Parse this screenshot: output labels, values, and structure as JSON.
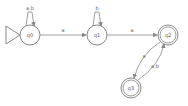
{
  "diagram": {
    "type": "finite-automaton",
    "states": [
      {
        "id": "q0",
        "label": "q0",
        "start": true,
        "accept": false
      },
      {
        "id": "q1",
        "label": "q1",
        "start": false,
        "accept": false
      },
      {
        "id": "q2",
        "label": "q2",
        "start": false,
        "accept": true
      },
      {
        "id": "q3",
        "label": "q3",
        "start": false,
        "accept": true
      }
    ],
    "transitions": [
      {
        "from": "q0",
        "to": "q0",
        "label": "a,b"
      },
      {
        "from": "q0",
        "to": "q1",
        "label": "a"
      },
      {
        "from": "q1",
        "to": "q1",
        "label": "b"
      },
      {
        "from": "q1",
        "to": "q2",
        "label": "a"
      },
      {
        "from": "q2",
        "to": "q3",
        "label": "a"
      },
      {
        "from": "q3",
        "to": "q2",
        "label": "a,b"
      }
    ],
    "colors": {
      "stroke": "#888888",
      "text": "#555555"
    }
  }
}
